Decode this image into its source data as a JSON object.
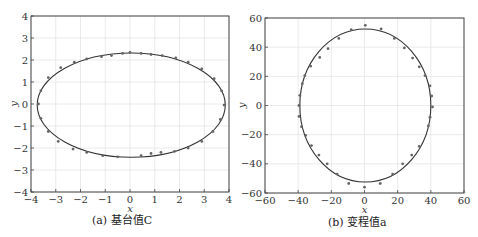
{
  "chart_data": [
    {
      "type": "scatter",
      "caption": "(a) 基台值C",
      "xlabel": "x",
      "ylabel": "y",
      "xlim": [
        -4,
        4
      ],
      "ylim": [
        -4,
        4
      ],
      "xticks": [
        -4,
        -3,
        -2,
        -1,
        0,
        1,
        2,
        3,
        4
      ],
      "yticks": [
        -4,
        -3,
        -2,
        -1,
        0,
        1,
        2,
        3,
        4
      ],
      "grid": true,
      "fit_ellipse": {
        "cx": 0.05,
        "cy": -0.05,
        "rx": 3.8,
        "ry": 2.37
      },
      "points": [
        [
          -3.6,
          0.6
        ],
        [
          -3.7,
          0.0
        ],
        [
          -3.6,
          -0.65
        ],
        [
          -3.3,
          -1.25
        ],
        [
          -2.9,
          -1.7
        ],
        [
          -2.3,
          -2.05
        ],
        [
          -1.75,
          -2.2
        ],
        [
          -1.1,
          -2.35
        ],
        [
          -0.5,
          -2.4
        ],
        [
          0.45,
          -2.35
        ],
        [
          0.85,
          -2.25
        ],
        [
          1.25,
          -2.2
        ],
        [
          1.8,
          -2.15
        ],
        [
          2.35,
          -2.0
        ],
        [
          2.9,
          -1.7
        ],
        [
          3.35,
          -1.25
        ],
        [
          3.65,
          -0.7
        ],
        [
          3.8,
          -0.05
        ],
        [
          3.7,
          0.6
        ],
        [
          3.4,
          1.15
        ],
        [
          2.9,
          1.6
        ],
        [
          2.35,
          1.9
        ],
        [
          1.85,
          2.1
        ],
        [
          1.3,
          2.2
        ],
        [
          0.85,
          2.25
        ],
        [
          0.45,
          2.3
        ],
        [
          0.0,
          2.35
        ],
        [
          -0.3,
          2.3
        ],
        [
          -0.75,
          2.2
        ],
        [
          -1.15,
          2.15
        ],
        [
          -1.75,
          2.05
        ],
        [
          -2.25,
          1.9
        ],
        [
          -2.8,
          1.65
        ],
        [
          -3.3,
          1.2
        ]
      ]
    },
    {
      "type": "scatter",
      "caption": "(b) 变程值a",
      "xlabel": "x",
      "ylabel": "y",
      "xlim": [
        -60,
        60
      ],
      "ylim": [
        -60,
        60
      ],
      "xticks": [
        -60,
        -40,
        -20,
        0,
        20,
        40,
        60
      ],
      "yticks": [
        -60,
        -40,
        -20,
        0,
        20,
        40,
        60
      ],
      "grid": true,
      "fit_ellipse": {
        "cx": 0.5,
        "cy": 0,
        "rx": 39.5,
        "ry": 52.5
      },
      "points": [
        [
          0.5,
          55
        ],
        [
          10,
          52.5
        ],
        [
          18,
          46
        ],
        [
          24,
          39.5
        ],
        [
          29,
          32.5
        ],
        [
          33,
          26.5
        ],
        [
          36.5,
          20.5
        ],
        [
          39.5,
          13.5
        ],
        [
          40.5,
          6.5
        ],
        [
          41,
          -1
        ],
        [
          39.5,
          -8
        ],
        [
          38.5,
          -14
        ],
        [
          33,
          -28
        ],
        [
          28.5,
          -34
        ],
        [
          23,
          -40
        ],
        [
          17,
          -47
        ],
        [
          9.5,
          -53.5
        ],
        [
          0,
          -56
        ],
        [
          -9.5,
          -53.5
        ],
        [
          -16.5,
          -47
        ],
        [
          -22.5,
          -40
        ],
        [
          -27.5,
          -34
        ],
        [
          -32,
          -27.5
        ],
        [
          -35.5,
          -20.5
        ],
        [
          -38,
          -14.5
        ],
        [
          -39.5,
          -7.5
        ],
        [
          -39.5,
          0
        ],
        [
          -39,
          7
        ],
        [
          -36,
          20.5
        ],
        [
          -32.5,
          27
        ],
        [
          -27,
          33
        ],
        [
          -22,
          39
        ],
        [
          -15.5,
          46
        ],
        [
          -8,
          52
        ],
        [
          -37.5,
          15
        ]
      ]
    }
  ]
}
